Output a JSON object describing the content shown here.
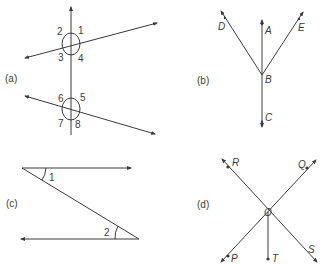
{
  "figure": {
    "panel_a": {
      "label": "(a)",
      "angles": [
        "1",
        "2",
        "3",
        "4",
        "5",
        "6",
        "7",
        "8"
      ]
    },
    "panel_b": {
      "label": "(b)",
      "points": [
        "A",
        "B",
        "C",
        "D",
        "E"
      ]
    },
    "panel_c": {
      "label": "(c)",
      "angles": [
        "1",
        "2"
      ]
    },
    "panel_d": {
      "label": "(d)",
      "points": [
        "O",
        "P",
        "Q",
        "R",
        "S",
        "T"
      ]
    }
  },
  "colors": {
    "stroke": "#3a3a3a",
    "background": "#ffffff"
  }
}
